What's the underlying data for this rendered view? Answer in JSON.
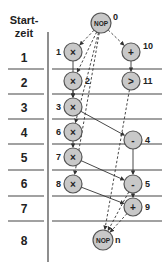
{
  "header": {
    "line1": "Start-",
    "line2": "zeit"
  },
  "rows": [
    {
      "label": "1",
      "y": 57
    },
    {
      "label": "2",
      "y": 82
    },
    {
      "label": "3",
      "y": 107
    },
    {
      "label": "4",
      "y": 132
    },
    {
      "label": "5",
      "y": 157
    },
    {
      "label": "6",
      "y": 183
    },
    {
      "label": "7",
      "y": 208
    },
    {
      "label": "8",
      "y": 240
    }
  ],
  "separators_y": [
    69,
    94,
    119,
    144,
    170,
    196,
    221
  ],
  "nodes": [
    {
      "id": "0",
      "op": "NOP",
      "x": 101,
      "y": 23,
      "label": "0",
      "label_side": "right"
    },
    {
      "id": "1",
      "op": "×",
      "x": 73,
      "y": 52,
      "label": "1",
      "label_side": "left"
    },
    {
      "id": "10",
      "op": "+",
      "x": 131,
      "y": 52,
      "label": "10",
      "label_side": "right"
    },
    {
      "id": "2",
      "op": "×",
      "x": 73,
      "y": 81,
      "label": "2",
      "label_side": "right"
    },
    {
      "id": "11",
      "op": ">",
      "x": 131,
      "y": 81,
      "label": "11",
      "label_side": "right"
    },
    {
      "id": "3",
      "op": "×",
      "x": 73,
      "y": 107,
      "label": "3",
      "label_side": "left"
    },
    {
      "id": "6",
      "op": "×",
      "x": 73,
      "y": 132,
      "label": "6",
      "label_side": "left"
    },
    {
      "id": "4",
      "op": "-",
      "x": 133,
      "y": 140,
      "label": "4",
      "label_side": "right"
    },
    {
      "id": "7",
      "op": "×",
      "x": 73,
      "y": 157,
      "label": "7",
      "label_side": "left"
    },
    {
      "id": "8",
      "op": "×",
      "x": 73,
      "y": 184,
      "label": "8",
      "label_side": "left"
    },
    {
      "id": "5",
      "op": "-",
      "x": 133,
      "y": 184,
      "label": "5",
      "label_side": "right"
    },
    {
      "id": "9",
      "op": "+",
      "x": 133,
      "y": 207,
      "label": "9",
      "label_side": "right"
    },
    {
      "id": "n",
      "op": "NOP",
      "x": 103,
      "y": 240,
      "label": "n",
      "label_side": "right"
    }
  ],
  "edges": [
    {
      "from": "0",
      "to": "1",
      "style": "dashed"
    },
    {
      "from": "0",
      "to": "2",
      "style": "dashed"
    },
    {
      "from": "0",
      "to": "6",
      "style": "dashed"
    },
    {
      "from": "0",
      "to": "8",
      "style": "dashed"
    },
    {
      "from": "0",
      "to": "10",
      "style": "dashed"
    },
    {
      "from": "10",
      "to": "11",
      "style": "solid"
    },
    {
      "from": "1",
      "to": "3",
      "style": "solid"
    },
    {
      "from": "2",
      "to": "3",
      "style": "solid"
    },
    {
      "from": "3",
      "to": "4",
      "style": "solid"
    },
    {
      "from": "6",
      "to": "7",
      "style": "solid"
    },
    {
      "from": "4",
      "to": "5",
      "style": "solid"
    },
    {
      "from": "7",
      "to": "5",
      "style": "solid"
    },
    {
      "from": "8",
      "to": "9",
      "style": "solid"
    },
    {
      "from": "5",
      "to": "9",
      "style": "solid"
    },
    {
      "from": "11",
      "to": "n",
      "style": "dashed"
    },
    {
      "from": "5",
      "to": "n",
      "style": "dashed"
    },
    {
      "from": "9",
      "to": "n",
      "style": "dashed"
    }
  ],
  "colors": {
    "node_fill": "#c8c8c8",
    "node_stroke": "#555555",
    "line": "#333333"
  }
}
